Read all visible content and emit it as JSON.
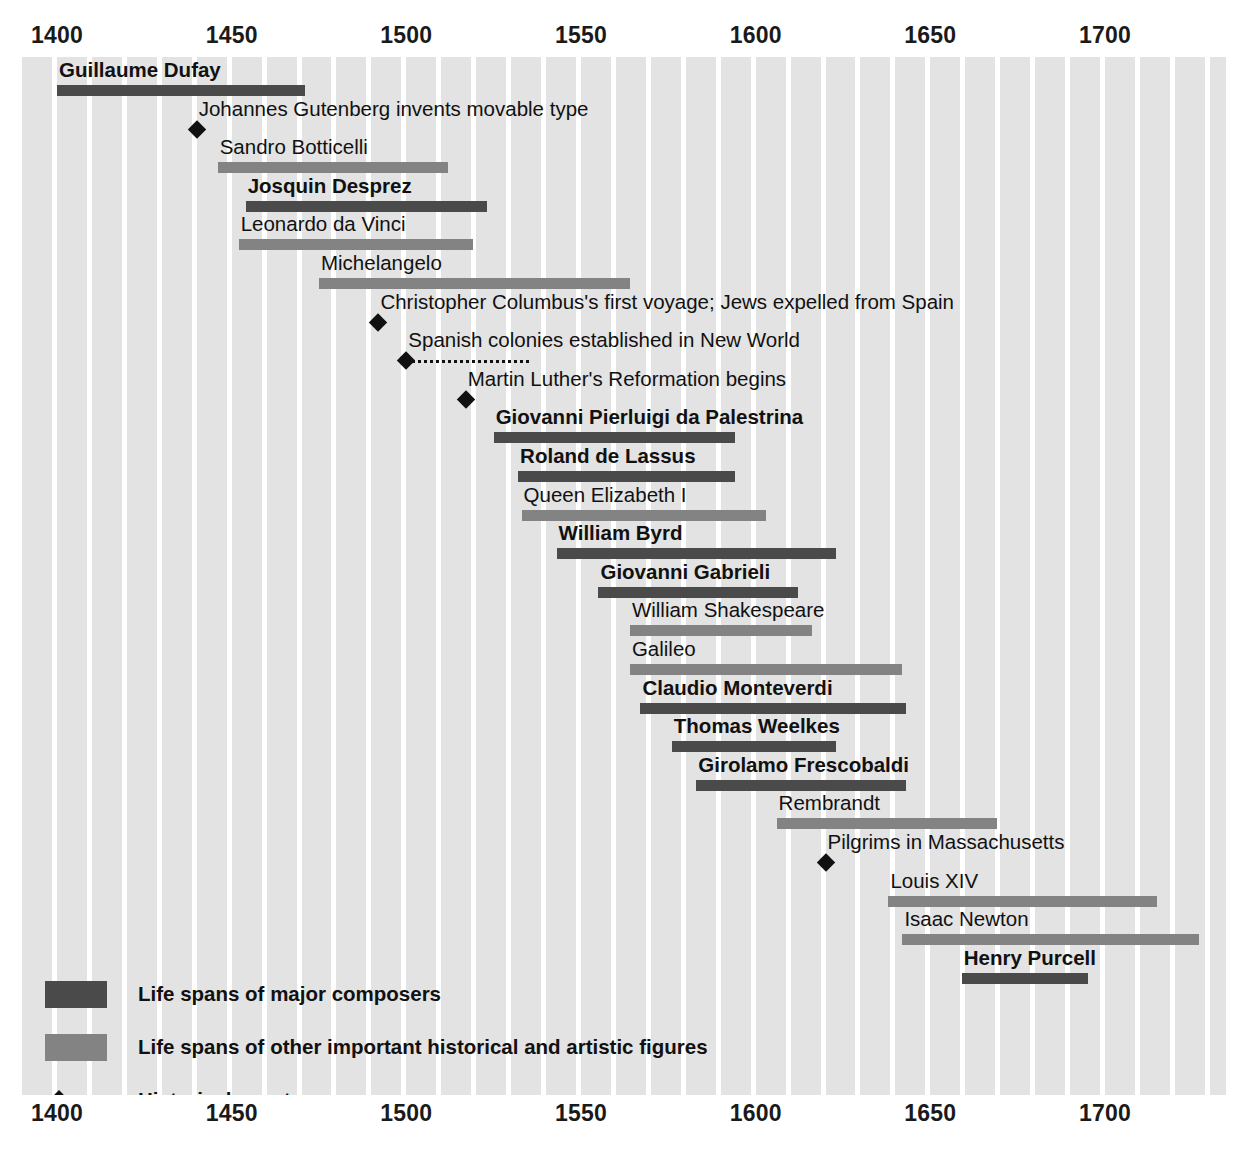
{
  "chart_data": {
    "type": "timeline",
    "title": "",
    "xlabel": "",
    "ylabel": "",
    "xlim": [
      1393,
      1730
    ],
    "axis_ticks": [
      1400,
      1450,
      1500,
      1550,
      1600,
      1650,
      1700
    ],
    "grid": "vertical decade bands",
    "legend_position": "bottom-left",
    "categories": [
      "Life spans of major composers",
      "Life spans of other important historical and artistic figures",
      "Historical events"
    ],
    "rows": [
      {
        "label": "Guillaume Dufay",
        "kind": "composer",
        "start": 1400,
        "end": 1471
      },
      {
        "label": "Johannes Gutenberg invents movable type",
        "kind": "event",
        "start": 1440,
        "end": 1440
      },
      {
        "label": "Sandro Botticelli",
        "kind": "figure",
        "start": 1446,
        "end": 1512
      },
      {
        "label": "Josquin Desprez",
        "kind": "composer",
        "start": 1454,
        "end": 1523
      },
      {
        "label": "Leonardo da Vinci",
        "kind": "figure",
        "start": 1452,
        "end": 1519
      },
      {
        "label": "Michelangelo",
        "kind": "figure",
        "start": 1475,
        "end": 1564
      },
      {
        "label": "Christopher Columbus's first voyage; Jews expelled from Spain",
        "kind": "event",
        "start": 1492,
        "end": 1492
      },
      {
        "label": "Spanish colonies established in New World",
        "kind": "event",
        "start": 1500,
        "end": 1535
      },
      {
        "label": "Martin Luther's Reformation begins",
        "kind": "event",
        "start": 1517,
        "end": 1517
      },
      {
        "label": "Giovanni Pierluigi da Palestrina",
        "kind": "composer",
        "start": 1525,
        "end": 1594
      },
      {
        "label": "Roland de Lassus",
        "kind": "composer",
        "start": 1532,
        "end": 1594
      },
      {
        "label": "Queen Elizabeth I",
        "kind": "figure",
        "start": 1533,
        "end": 1603
      },
      {
        "label": "William Byrd",
        "kind": "composer",
        "start": 1543,
        "end": 1623
      },
      {
        "label": "Giovanni Gabrieli",
        "kind": "composer",
        "start": 1555,
        "end": 1612
      },
      {
        "label": "William Shakespeare",
        "kind": "figure",
        "start": 1564,
        "end": 1616
      },
      {
        "label": "Galileo",
        "kind": "figure",
        "start": 1564,
        "end": 1642
      },
      {
        "label": "Claudio Monteverdi",
        "kind": "composer",
        "start": 1567,
        "end": 1643
      },
      {
        "label": "Thomas Weelkes",
        "kind": "composer",
        "start": 1576,
        "end": 1623
      },
      {
        "label": "Girolamo Frescobaldi",
        "kind": "composer",
        "start": 1583,
        "end": 1643
      },
      {
        "label": "Rembrandt",
        "kind": "figure",
        "start": 1606,
        "end": 1669
      },
      {
        "label": "Pilgrims in Massachusetts",
        "kind": "event",
        "start": 1620,
        "end": 1620
      },
      {
        "label": "Louis XIV",
        "kind": "figure",
        "start": 1638,
        "end": 1715
      },
      {
        "label": "Isaac Newton",
        "kind": "figure",
        "start": 1642,
        "end": 1727
      },
      {
        "label": "Henry Purcell",
        "kind": "composer",
        "start": 1659,
        "end": 1695
      }
    ]
  },
  "axis": {
    "ticks": [
      "1400",
      "1450",
      "1500",
      "1550",
      "1600",
      "1650",
      "1700"
    ]
  },
  "legend": {
    "items": [
      {
        "glyph": "composer-swatch",
        "text": "Life spans of major composers"
      },
      {
        "glyph": "figure-swatch",
        "text": "Life spans of other important historical and artistic figures"
      },
      {
        "glyph": "event-diamond",
        "text": "Historical events"
      }
    ]
  },
  "colors": {
    "composer_bar": "#4a4a4a",
    "figure_bar": "#838383",
    "band": "#e3e3e3",
    "event": "#111111",
    "background": "#ffffff"
  }
}
